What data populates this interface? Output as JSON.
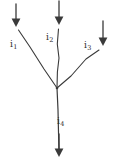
{
  "figure": {
    "kind": "current-junction-diagram",
    "stroke_color": "#3a3a3a",
    "background_color": "#ffffff",
    "width": 113,
    "height": 164,
    "junction": {
      "x": 57,
      "y": 88
    },
    "labels": [
      {
        "id": "i1",
        "base": "i",
        "subscript": "1",
        "text": "i1"
      },
      {
        "id": "i2",
        "base": "i",
        "subscript": "2",
        "text": "i2"
      },
      {
        "id": "i3",
        "base": "i",
        "subscript": "3",
        "text": "i3"
      },
      {
        "id": "i4",
        "base": "i",
        "subscript": "4",
        "text": "i4"
      }
    ],
    "branches": [
      {
        "id": "branch-i1",
        "label": "i1",
        "direction": "into-junction",
        "path": "M 18.5,30 L 30,47 L 44,69 L 57,88"
      },
      {
        "id": "branch-i2",
        "label": "i2",
        "direction": "into-junction",
        "path": "M 58.5,29 L 57.5,44 L 59,58 L 57.5,72 L 57,88"
      },
      {
        "id": "branch-i3",
        "label": "i3",
        "direction": "into-junction",
        "path": "M 99,50 L 86,59 L 71,76 L 57,88"
      },
      {
        "id": "branch-i4",
        "label": "i4",
        "direction": "out-of-junction",
        "path": "M 57,88 L 58,110 L 58.5,132 L 59,150"
      }
    ],
    "arrows": [
      {
        "id": "arrow-i1",
        "points": "down",
        "x": 16,
        "y_start": 4,
        "y_end": 27
      },
      {
        "id": "arrow-i2",
        "points": "down",
        "x": 59,
        "y_start": 1,
        "y_end": 25
      },
      {
        "id": "arrow-i3",
        "points": "down",
        "x": 103,
        "y_start": 21,
        "y_end": 46
      },
      {
        "id": "arrow-i4",
        "points": "down",
        "x": 59,
        "y_start": 134,
        "y_end": 157
      }
    ]
  }
}
